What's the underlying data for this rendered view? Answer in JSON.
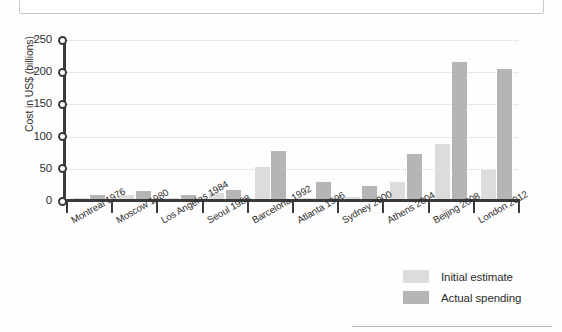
{
  "chart_data": {
    "type": "bar",
    "title": "",
    "xlabel": "",
    "ylabel": "Cost in US$ (billions)",
    "ylim": [
      0,
      250
    ],
    "yticks": [
      0,
      50,
      100,
      150,
      200,
      250
    ],
    "grid": true,
    "legend_position": "bottom-right",
    "categories": [
      "Montreal 1976",
      "Moscow 1980",
      "Los Angeles 1984",
      "Seoul 1988",
      "Barcelona 1992",
      "Atlanta 1996",
      "Sydney 2000",
      "Athens 2004",
      "Beijing 2008",
      "London 2012"
    ],
    "series": [
      {
        "name": "Initial estimate",
        "color": "#dcdcdc",
        "values": [
          5,
          9,
          5,
          13,
          53,
          5,
          7,
          30,
          88,
          48
        ]
      },
      {
        "name": "Actual spending",
        "color": "#b5b5b5",
        "values": [
          10,
          16,
          10,
          17,
          77,
          30,
          23,
          73,
          216,
          205
        ]
      }
    ]
  },
  "axis": {
    "y_label": "Cost in US$ (billions)",
    "y_tick_labels": [
      "250",
      "200",
      "150",
      "100",
      "50",
      "0"
    ]
  },
  "legend": {
    "items": [
      {
        "label": "Initial estimate",
        "color": "#dcdcdc"
      },
      {
        "label": "Actual spending",
        "color": "#b5b5b5"
      }
    ]
  },
  "colors": {
    "initial_estimate": "#dcdcdc",
    "actual_spending": "#b5b5b5",
    "axis": "#3a3a3a",
    "gridline": "#d2d2d2",
    "text": "#2d2d2d",
    "page_background": "#fefefe"
  }
}
